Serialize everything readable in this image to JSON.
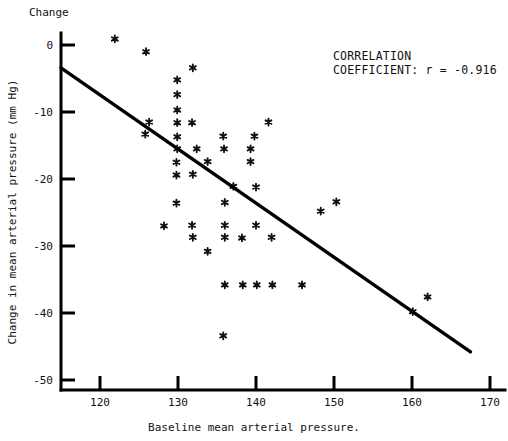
{
  "chart_data": {
    "type": "scatter",
    "title": "",
    "corner_label": "Change",
    "xlabel": "Baseline mean arterial pressure.",
    "ylabel": "Change in mean arterial pressure (mm Hg)",
    "xlim": [
      115,
      170
    ],
    "ylim": [
      -53,
      1
    ],
    "xticks": [
      120,
      130,
      140,
      150,
      160,
      170
    ],
    "yticks": [
      0,
      -10,
      -20,
      -30,
      -40,
      -50
    ],
    "xtick_labels": [
      "120",
      "130",
      "140",
      "150",
      "160",
      "170"
    ],
    "ytick_labels": [
      "0",
      "-10",
      "-20",
      "-30",
      "-40",
      "-50"
    ],
    "grid": false,
    "legend": "none",
    "marker": "asterisk",
    "annotations": [
      {
        "line1": "CORRELATION",
        "line2": "COEFFICIENT:  r = -0.916"
      }
    ],
    "correlation_coefficient": -0.916,
    "fit_line": {
      "x_start": 115.0,
      "y_start": -3.4,
      "x_end": 167.5,
      "y_end": -45.8
    },
    "points": [
      {
        "x": 121.9,
        "y": 0.9
      },
      {
        "x": 125.9,
        "y": -1.0
      },
      {
        "x": 131.9,
        "y": -3.4
      },
      {
        "x": 129.9,
        "y": -5.2
      },
      {
        "x": 129.9,
        "y": -7.4
      },
      {
        "x": 129.9,
        "y": -9.7
      },
      {
        "x": 126.3,
        "y": -11.5
      },
      {
        "x": 129.9,
        "y": -11.6
      },
      {
        "x": 131.8,
        "y": -11.6
      },
      {
        "x": 141.6,
        "y": -11.5
      },
      {
        "x": 125.8,
        "y": -13.3
      },
      {
        "x": 129.9,
        "y": -13.7
      },
      {
        "x": 135.8,
        "y": -13.6
      },
      {
        "x": 139.8,
        "y": -13.6
      },
      {
        "x": 129.9,
        "y": -15.5
      },
      {
        "x": 132.4,
        "y": -15.5
      },
      {
        "x": 135.9,
        "y": -15.5
      },
      {
        "x": 139.3,
        "y": -15.5
      },
      {
        "x": 129.8,
        "y": -17.5
      },
      {
        "x": 133.8,
        "y": -17.4
      },
      {
        "x": 139.3,
        "y": -17.4
      },
      {
        "x": 129.8,
        "y": -19.4
      },
      {
        "x": 131.9,
        "y": -19.3
      },
      {
        "x": 137.1,
        "y": -21.1
      },
      {
        "x": 140.0,
        "y": -21.2
      },
      {
        "x": 129.8,
        "y": -23.6
      },
      {
        "x": 136.0,
        "y": -23.5
      },
      {
        "x": 150.3,
        "y": -23.4
      },
      {
        "x": 148.3,
        "y": -24.8
      },
      {
        "x": 128.2,
        "y": -27.0
      },
      {
        "x": 131.8,
        "y": -26.9
      },
      {
        "x": 136.0,
        "y": -26.9
      },
      {
        "x": 140.0,
        "y": -26.9
      },
      {
        "x": 131.9,
        "y": -28.7
      },
      {
        "x": 136.0,
        "y": -28.7
      },
      {
        "x": 138.2,
        "y": -28.8
      },
      {
        "x": 142.0,
        "y": -28.7
      },
      {
        "x": 133.8,
        "y": -30.8
      },
      {
        "x": 136.0,
        "y": -35.8
      },
      {
        "x": 138.3,
        "y": -35.8
      },
      {
        "x": 140.1,
        "y": -35.8
      },
      {
        "x": 142.1,
        "y": -35.8
      },
      {
        "x": 145.9,
        "y": -35.8
      },
      {
        "x": 135.8,
        "y": -43.4
      },
      {
        "x": 160.1,
        "y": -39.8
      },
      {
        "x": 162.0,
        "y": -37.6
      }
    ]
  }
}
